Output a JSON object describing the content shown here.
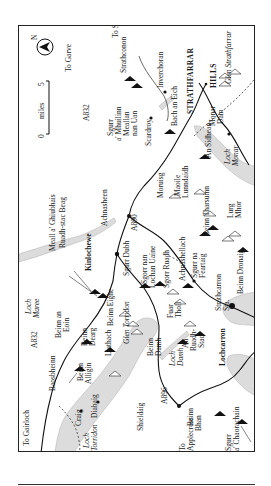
{
  "map": {
    "orientation": "rotated 90° (north points left)",
    "scale_bar": {
      "start": "0",
      "unit": "miles",
      "end": "5"
    },
    "north_label": "N",
    "roads": [
      {
        "label": "A832"
      },
      {
        "label": "A832 (south)",
        "text": "A832"
      },
      {
        "label": "A890"
      },
      {
        "label": "A896"
      }
    ],
    "road_labels": {
      "a832_north": "A832",
      "a832_south": "A832",
      "a890": "A890",
      "a896": "A896"
    },
    "directions": {
      "to_garve": "To Garve",
      "to_struy": "To Struy",
      "to_strathconon": "Strathconon",
      "to_gairloch": "To Gairloch",
      "to_applecross_1": "To",
      "to_applecross_2": "Applecross"
    },
    "towns": {
      "kinlochewe": "Kinlochewe",
      "lochcarron": "Lochcarron",
      "achnasheen": "Achnasheen",
      "achnashellach": "Achnashellach",
      "strathcarron_1": "Strathcarron",
      "strathcarron_2": "Sta.",
      "shieldaig": "Shieldaig",
      "diabaig": "Diabaig",
      "craig": "Craig",
      "scardroy": "Scardroy",
      "inverchoran": "Inverchoran",
      "monar_dam_1": "Monar",
      "monar_dam_2": "Dam"
    },
    "regions": {
      "strathfarrar": "STRATHFARRAR",
      "hills": "HILLS"
    },
    "glens": {
      "glen_strathfarrar": "Glen Strathfarrar",
      "glen_torridon": "Glen Torridon"
    },
    "lochs": {
      "loch_maree_1": "Loch",
      "loch_maree_2": "Maree",
      "loch_torridon_1": "Loch",
      "loch_torridon_2": "Torridon",
      "loch_dughaill_1": "Loch",
      "loch_dughaill_2": "Damh",
      "loch_monar_1": "Loch",
      "loch_monar_2": "Monar"
    },
    "peaks": {
      "sgurr_a_mhuilinn_1": "Sgurr",
      "sgurr_a_mhuilinn_2": "a' Mhuilinn",
      "meallan_nan_uan_1": "Meallan",
      "meallan_nan_uan_2": "nan Uan",
      "bac_an_eich": "Bach an Eich",
      "an_sidhean": "An Sidhean",
      "maoile_lunndaidh_1": "Maoile",
      "maoile_lunndaidh_2": "Lunndaidh",
      "moruisg": "Moruisg",
      "beinn_tharsuinn": "Beinn Tharsuinn",
      "lurg_mhor_1": "Lurg",
      "lurg_mhor_2": "Mhor",
      "sgurr_na_feartaig_1": "Sgurr na",
      "sgurr_na_feartaig_2": "Feartaig",
      "beinn_dronaig": "Beinn Dronaig",
      "meall_a_ghiubhais": "Meall a' Ghiubhais",
      "ruadh_stac_beag": "Ruadh-stac Beag",
      "sgurr_dubh": "Sgurr Dubh",
      "sgorr_nan_lochan_uaine_1": "Sgorr nan",
      "sgorr_nan_lochan_uaine_2": "Lochan Uaine",
      "sgorr_ruadh": "Sgorr Ruadh",
      "fuar_tholl_1": "Fuar",
      "fuar_tholl_2": "Tholl",
      "beinn_eighe": "Beinn Eighe",
      "liathach": "Liathach",
      "beinn_an_eoin_1": "Beinn an",
      "beinn_an_eoin_2": "Eoin",
      "beinn_dearg_1": "Beinn",
      "beinn_dearg_2": "Dearg",
      "baosbheinn": "Baosbheinn",
      "beinn_alligin_1": "Beinn",
      "beinn_alligin_2": "Alligin",
      "beinn_damh_1": "Beinn",
      "beinn_damh_2": "Damh",
      "an_ruadh_stac_1": "An",
      "an_ruadh_stac_2": "Ruadh-",
      "an_ruadh_stac_3": "Stac",
      "beinn_bhan_1": "Beinn",
      "beinn_bhan_2": "Bhan",
      "sgurr_a_chaorachain_1": "Sgurr",
      "sgurr_a_chaorachain_2": "a' Chaorachain"
    },
    "colors": {
      "ink": "#1a1a1a",
      "water": "#d9d9d9",
      "water_edge": "#bdbdbd",
      "frame": "#222222"
    }
  }
}
